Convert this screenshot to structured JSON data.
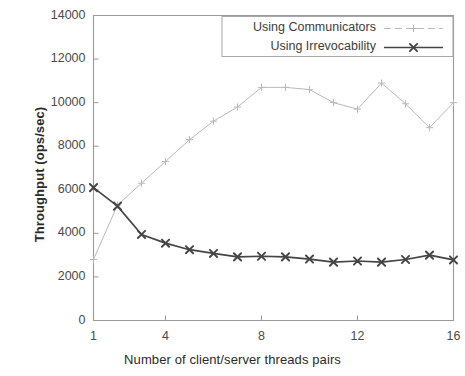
{
  "chart_data": {
    "type": "line",
    "title": "",
    "xlabel": "Number of client/server threads pairs",
    "ylabel": "Throughput (ops/sec)",
    "xlim": [
      1,
      16
    ],
    "ylim": [
      0,
      14000
    ],
    "grid": false,
    "legend_position": "top-right",
    "x": [
      1,
      2,
      3,
      4,
      5,
      6,
      7,
      8,
      9,
      10,
      11,
      12,
      13,
      14,
      15,
      16
    ],
    "xticks": [
      1,
      4,
      8,
      12,
      16
    ],
    "xtick_labels": [
      "1",
      "4",
      "8",
      "12",
      "16"
    ],
    "yticks": [
      0,
      2000,
      4000,
      6000,
      8000,
      10000,
      12000,
      14000
    ],
    "ytick_labels": [
      "0",
      "2000",
      "4000",
      "6000",
      "8000",
      "10000",
      "12000",
      "14000"
    ],
    "series": [
      {
        "name": "Using Communicators",
        "color": "#b9b9b9",
        "marker": "plus",
        "values": [
          2800,
          5300,
          6300,
          7300,
          8300,
          9150,
          9800,
          10700,
          10700,
          10600,
          10000,
          9700,
          10900,
          9950,
          8850,
          10000
        ]
      },
      {
        "name": "Using Irrevocability",
        "color": "#454545",
        "marker": "cross",
        "values": [
          6100,
          5250,
          3950,
          3550,
          3250,
          3080,
          2920,
          2950,
          2920,
          2820,
          2680,
          2730,
          2680,
          2800,
          3000,
          2780
        ]
      }
    ]
  },
  "legend": {
    "items": [
      {
        "label": "Using Communicators"
      },
      {
        "label": "Using Irrevocability"
      }
    ]
  },
  "axes": {
    "x_title": "Number of client/server threads pairs",
    "y_title": "Throughput (ops/sec)"
  }
}
